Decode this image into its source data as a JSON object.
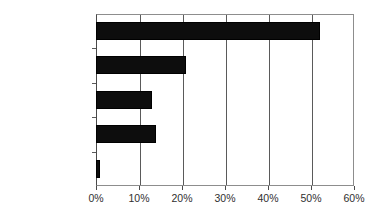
{
  "chart_data": {
    "type": "bar",
    "orientation": "horizontal",
    "title": "",
    "subtitle": "",
    "xlabel": "",
    "ylabel": "",
    "categories": [
      "Regular (52%)",
      "Flextime 21%)",
      "CWW (13%)",
      "Other (14%)",
      "Telew ork (1%)"
    ],
    "values": [
      52,
      21,
      13,
      14,
      1
    ],
    "xlim": [
      0,
      60
    ],
    "xticks": [
      0,
      10,
      20,
      30,
      40,
      50,
      60
    ],
    "xtick_labels": [
      "0%",
      "10%",
      "20%",
      "30%",
      "40%",
      "50%",
      "60%"
    ],
    "grid": true,
    "grid_axis": "x",
    "legend": false,
    "legend_position": "none",
    "bar_color": "#0d0d0d",
    "grid_color": "#5a5a5a",
    "axis_color": "#4a4a4a",
    "text_color": "#2f2f2f",
    "background": "#ffffff"
  }
}
